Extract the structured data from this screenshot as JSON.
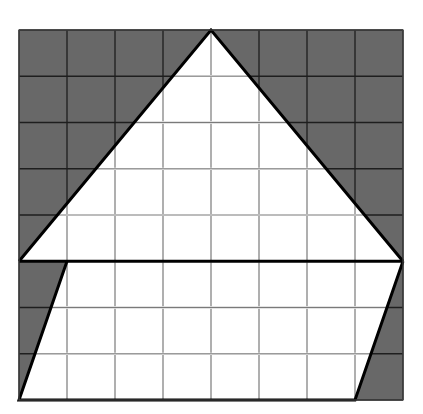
{
  "figure": {
    "width": 423,
    "height": 414,
    "grid": {
      "cols": 8,
      "rows": 8,
      "x0": 19,
      "y0": 30,
      "x1": 403,
      "y1": 400
    },
    "colors": {
      "shaded": "#686868",
      "unshaded": "#ffffff",
      "grid_line_on_shaded": "#1e1e1e",
      "grid_line_on_white": "#7a7a7a",
      "outline": "#000000"
    },
    "shape": {
      "description": "House-like polygon: triangle roof on top of a slanted quadrilateral base",
      "vertices_grid_units": [
        [
          4,
          0
        ],
        [
          8,
          5
        ],
        [
          7,
          8
        ],
        [
          0,
          8
        ],
        [
          1,
          5
        ],
        [
          0,
          5
        ]
      ],
      "roof_triangle_grid_units": [
        [
          0,
          5
        ],
        [
          4,
          0
        ],
        [
          8,
          5
        ]
      ],
      "base_quad_grid_units": [
        [
          1,
          5
        ],
        [
          8,
          5
        ],
        [
          7,
          8
        ],
        [
          0,
          8
        ]
      ]
    }
  }
}
